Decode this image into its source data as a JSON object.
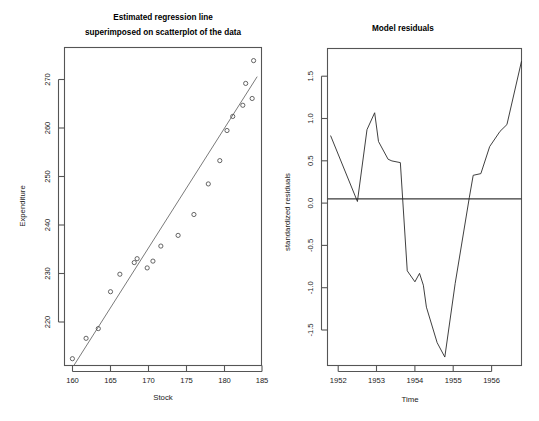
{
  "figure": {
    "width": 539,
    "height": 421,
    "background": "#ffffff",
    "panels": 2
  },
  "chart_data": [
    {
      "type": "scatter",
      "id": "regression-scatter",
      "title": "Estimated regression line",
      "title_line2": "superimposed on scatterplot of the data",
      "xlabel": "Stock",
      "ylabel": "Expenditure",
      "xlim": [
        158.2,
        185.6
      ],
      "ylim": [
        212.0,
        277.5
      ],
      "xticks": [
        160,
        165,
        170,
        175,
        180,
        185
      ],
      "yticks": [
        220,
        230,
        240,
        250,
        260,
        270
      ],
      "grid": false,
      "legend": "none",
      "x": [
        159.3,
        161.2,
        162.9,
        164.6,
        165.9,
        167.9,
        168.3,
        169.7,
        170.5,
        171.6,
        174.0,
        176.2,
        178.2,
        179.8,
        180.8,
        181.6,
        183.0,
        184.3
      ],
      "y": [
        213.4,
        217.6,
        219.6,
        227.2,
        230.8,
        233.2,
        234.0,
        232.1,
        233.5,
        236.6,
        238.8,
        243.1,
        249.4,
        254.2,
        260.4,
        263.3,
        265.6,
        267.0
      ],
      "extra_points": {
        "x": [
          184.5,
          183.4
        ],
        "y": [
          274.8,
          270.1
        ]
      },
      "fit_line": {
        "name": "estimated regression line",
        "x_start": 159.5,
        "y_start": 212.0,
        "x_end": 185.0,
        "y_end": 271.5,
        "color": "#6b6b6b"
      },
      "point_marker": "open-circle"
    },
    {
      "type": "line",
      "id": "model-residuals",
      "title": "Model residuals",
      "xlabel": "Time",
      "ylabel": "standardized residuals",
      "xlim": [
        1951.72,
        1956.78
      ],
      "ylim": [
        -1.97,
        1.78
      ],
      "xticks": [
        1952,
        1953,
        1954,
        1955,
        1956
      ],
      "xtick_labels": [
        "1952",
        "1953",
        "1954",
        "1955",
        "1956"
      ],
      "yticks": [
        -1.5,
        -1.0,
        -0.5,
        0.0,
        0.5,
        1.0,
        1.5
      ],
      "ytick_labels": [
        "-1.5",
        "-1.0",
        "-0.5",
        "0.0",
        "0.5",
        "1.0",
        "1.5"
      ],
      "grid": false,
      "legend": "none",
      "zero_reference_line": 0.0,
      "series": [
        {
          "name": "standardized residuals",
          "color": "#2a2a2a",
          "x": [
            1951.8,
            1952.5,
            1952.75,
            1952.95,
            1953.05,
            1953.3,
            1953.4,
            1953.62,
            1953.8,
            1954.0,
            1954.12,
            1954.22,
            1954.3,
            1954.58,
            1954.78,
            1955.05,
            1955.42,
            1955.52,
            1955.72,
            1955.95,
            1956.22,
            1956.4,
            1956.78
          ],
          "y": [
            0.75,
            -0.03,
            0.82,
            1.02,
            0.68,
            0.47,
            0.45,
            0.43,
            -0.85,
            -0.98,
            -0.88,
            -1.02,
            -1.28,
            -1.7,
            -1.87,
            -1.0,
            0.02,
            0.28,
            0.3,
            0.62,
            0.8,
            0.88,
            1.63
          ]
        }
      ]
    }
  ]
}
